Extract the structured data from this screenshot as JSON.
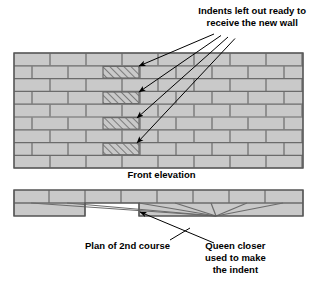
{
  "diagram": {
    "title_note": "Indents left out ready to\nreceive the new wall",
    "front_elevation_label": "Front elevation",
    "plan_label": "Plan of 2nd course",
    "queen_closer_note": "Queen closer\nused to make\nthe indent",
    "colors": {
      "brick_fill": "#c9c9c9",
      "mortar_line": "#6b6b6b",
      "outline": "#555555",
      "hatch_line": "#3a3a3a",
      "leader_line": "#000000",
      "background": "#ffffff",
      "text": "#000000"
    },
    "elevation": {
      "x": 14,
      "y": 53,
      "width": 289,
      "height": 115,
      "course_count": 9,
      "course_height": 12.8,
      "brick_length": 36,
      "indent_courses": [
        1,
        3,
        5,
        7
      ],
      "indent_x": 103,
      "indent_width": 36
    },
    "plan": {
      "x": 14,
      "y": 190,
      "width": 289,
      "height": 26,
      "leaf_split_y": 203,
      "notch": {
        "x": 85,
        "y": 203,
        "width": 54,
        "height": 13
      },
      "joints_top": [
        49,
        85,
        121,
        157,
        193,
        229,
        265
      ],
      "joints_bottom": [
        31,
        67,
        139,
        175,
        211,
        247,
        283
      ]
    },
    "leaders": {
      "indent_origin_x": 214,
      "indent_origin_y": 34,
      "arrow_targets": [
        {
          "x": 139,
          "y": 66
        },
        {
          "x": 139,
          "y": 92
        },
        {
          "x": 137,
          "y": 118
        },
        {
          "x": 137,
          "y": 143
        }
      ],
      "queen_origin": {
        "x": 214,
        "y": 243
      },
      "queen_target": {
        "x": 140,
        "y": 212
      },
      "plan_label_leader": {
        "x1": 170,
        "y1": 240,
        "x2": 190,
        "y2": 228
      }
    }
  }
}
